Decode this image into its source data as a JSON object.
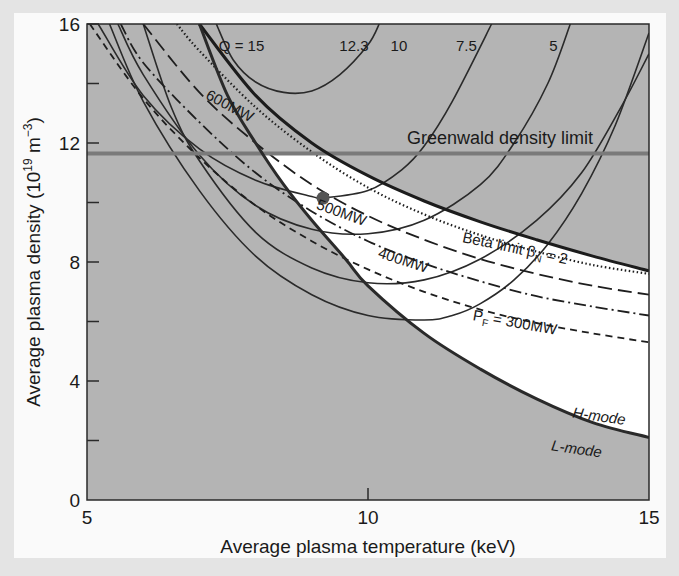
{
  "chart_data": {
    "type": "line",
    "title": "",
    "xlabel": "Average plasma temperature (keV)",
    "ylabel": "Average plasma density (10^19 m^-3)",
    "ylabel_parts": {
      "main": "Average plasma density (10",
      "sup1": "19",
      "mid": " m",
      "sup2": "−3",
      "end": ")"
    },
    "xlim": [
      5,
      15
    ],
    "ylim": [
      0,
      16
    ],
    "x_ticks": [
      5,
      10,
      15
    ],
    "x_tick_labels": [
      "5",
      "10",
      "15"
    ],
    "y_ticks": [
      0,
      2,
      4,
      6,
      8,
      10,
      12,
      14,
      16
    ],
    "y_tick_labels": [
      "0",
      "",
      "4",
      "",
      "8",
      "",
      "12",
      "",
      "16"
    ],
    "grid": false,
    "background_shading": {
      "excluded_region": "#b4b4b4",
      "operating_window": "#ffffff"
    },
    "greenwald_limit": {
      "label": "Greenwald density limit",
      "y": 11.65,
      "color": "#7a7a7a"
    },
    "beta_limit": {
      "label": "Beta limit βN = 2",
      "points": [
        [
          7.0,
          16
        ],
        [
          8,
          13.6
        ],
        [
          9,
          12.0
        ],
        [
          10,
          10.9
        ],
        [
          11,
          10.05
        ],
        [
          12,
          9.35
        ],
        [
          13,
          8.75
        ],
        [
          14,
          8.2
        ],
        [
          15,
          7.7
        ]
      ]
    },
    "h_mode_boundary": {
      "label_above": "H-mode",
      "label_below": "L-mode",
      "points": [
        [
          7.0,
          16
        ],
        [
          7.5,
          13.6
        ],
        [
          8,
          12.0
        ],
        [
          8.5,
          10.6
        ],
        [
          9,
          9.4
        ],
        [
          9.6,
          8.1
        ],
        [
          10,
          7.2
        ],
        [
          11,
          5.6
        ],
        [
          12,
          4.4
        ],
        [
          13,
          3.4
        ],
        [
          14,
          2.6
        ],
        [
          15,
          2.1
        ]
      ]
    },
    "fusion_power_curves": [
      {
        "name": "600MW",
        "style": "dotted",
        "points": [
          [
            6.6,
            16
          ],
          [
            7,
            15.1
          ],
          [
            8,
            13.2
          ],
          [
            9,
            11.7
          ],
          [
            10,
            10.5
          ],
          [
            11,
            9.6
          ],
          [
            12,
            8.9
          ],
          [
            13,
            8.35
          ],
          [
            14,
            7.9
          ],
          [
            15,
            7.6
          ]
        ]
      },
      {
        "name": "500MW",
        "style": "long-dash",
        "points": [
          [
            6.0,
            16
          ],
          [
            7,
            13.7
          ],
          [
            8,
            12.0
          ],
          [
            9,
            10.6
          ],
          [
            10,
            9.55
          ],
          [
            11,
            8.75
          ],
          [
            12,
            8.1
          ],
          [
            13,
            7.6
          ],
          [
            14,
            7.2
          ],
          [
            15,
            6.9
          ]
        ]
      },
      {
        "name": "400MW",
        "style": "dash-dot",
        "points": [
          [
            5.6,
            16
          ],
          [
            6,
            14.7
          ],
          [
            7,
            12.7
          ],
          [
            8,
            11.0
          ],
          [
            9,
            9.7
          ],
          [
            10,
            8.7
          ],
          [
            11,
            7.95
          ],
          [
            12,
            7.35
          ],
          [
            13,
            6.85
          ],
          [
            14,
            6.5
          ],
          [
            15,
            6.2
          ]
        ]
      },
      {
        "name": "PF = 300MW",
        "style": "short-dash",
        "points": [
          [
            5.05,
            16
          ],
          [
            6,
            13.5
          ],
          [
            7,
            11.5
          ],
          [
            8,
            9.9
          ],
          [
            9,
            8.7
          ],
          [
            10,
            7.75
          ],
          [
            11,
            7.0
          ],
          [
            12,
            6.4
          ],
          [
            13,
            5.95
          ],
          [
            14,
            5.6
          ],
          [
            15,
            5.3
          ]
        ]
      }
    ],
    "q_curves": [
      {
        "name": "Q = 15",
        "label": "Q = 15",
        "points": [
          [
            7.3,
            16
          ],
          [
            7.6,
            14.8
          ],
          [
            8,
            14.05
          ],
          [
            8.5,
            13.7
          ],
          [
            9,
            13.75
          ],
          [
            9.5,
            14.3
          ],
          [
            10,
            15.3
          ],
          [
            10.2,
            16
          ]
        ]
      },
      {
        "name": "12.3",
        "label": "12.3",
        "points": [
          [
            5.2,
            16
          ],
          [
            6,
            13.6
          ],
          [
            7,
            11.8
          ],
          [
            8,
            10.75
          ],
          [
            9,
            10.2
          ],
          [
            9.2,
            10.15
          ],
          [
            10,
            10.4
          ],
          [
            10.6,
            11.1
          ],
          [
            11,
            11.9
          ],
          [
            11.5,
            13.4
          ],
          [
            12.2,
            16
          ]
        ]
      },
      {
        "name": "10",
        "label": "10",
        "points": [
          [
            5.55,
            16
          ],
          [
            6,
            14.3
          ],
          [
            7,
            11.6
          ],
          [
            8,
            9.9
          ],
          [
            9,
            9.1
          ],
          [
            10,
            8.95
          ],
          [
            11,
            9.4
          ],
          [
            12,
            10.6
          ],
          [
            12.6,
            12.0
          ],
          [
            13.2,
            14.0
          ],
          [
            13.6,
            16
          ]
        ]
      },
      {
        "name": "7.5",
        "label": "7.5",
        "points": [
          [
            6.0,
            16
          ],
          [
            6.5,
            13.2
          ],
          [
            7,
            11.4
          ],
          [
            8,
            9.0
          ],
          [
            9,
            7.8
          ],
          [
            10,
            7.3
          ],
          [
            11,
            7.4
          ],
          [
            12,
            8.1
          ],
          [
            13,
            9.4
          ],
          [
            13.8,
            11.0
          ],
          [
            14.5,
            13.2
          ],
          [
            15,
            15.0
          ]
        ]
      },
      {
        "name": "5",
        "label": "5",
        "points": [
          [
            5.4,
            16
          ],
          [
            6,
            13.4
          ],
          [
            7,
            10.4
          ],
          [
            8,
            8.2
          ],
          [
            9,
            6.9
          ],
          [
            10,
            6.2
          ],
          [
            11,
            6.05
          ],
          [
            11.5,
            6.2
          ],
          [
            12,
            6.6
          ],
          [
            12.6,
            7.4
          ],
          [
            13.2,
            8.6
          ],
          [
            13.8,
            10.3
          ],
          [
            14.4,
            12.6
          ],
          [
            15,
            15.7
          ]
        ]
      }
    ],
    "operating_point": {
      "T": 9.2,
      "n": 10.15,
      "color": "#555555"
    },
    "annotations": [
      {
        "text": "Q = 15",
        "x": 7.75,
        "y": 15.1
      },
      {
        "text": "12.3",
        "x": 9.75,
        "y": 15.1
      },
      {
        "text": "10",
        "x": 10.55,
        "y": 15.1
      },
      {
        "text": "7.5",
        "x": 11.75,
        "y": 15.1
      },
      {
        "text": "5",
        "x": 13.3,
        "y": 15.1
      },
      {
        "text": "600MW",
        "x": 7.5,
        "y": 13.1
      },
      {
        "text": "500MW",
        "x": 9.5,
        "y": 9.5
      },
      {
        "text": "400MW",
        "x": 10.6,
        "y": 7.9
      },
      {
        "text": "PF = 300MW",
        "x": 12.6,
        "y": 5.8
      },
      {
        "text": "Greenwald density limit",
        "x": 12.35,
        "y": 11.95
      },
      {
        "text": "Beta limit βN = 2",
        "x": 12.6,
        "y": 8.3
      },
      {
        "text": "H-mode",
        "x": 14.1,
        "y": 2.65
      },
      {
        "text": "L-mode",
        "x": 13.7,
        "y": 1.55
      }
    ]
  }
}
